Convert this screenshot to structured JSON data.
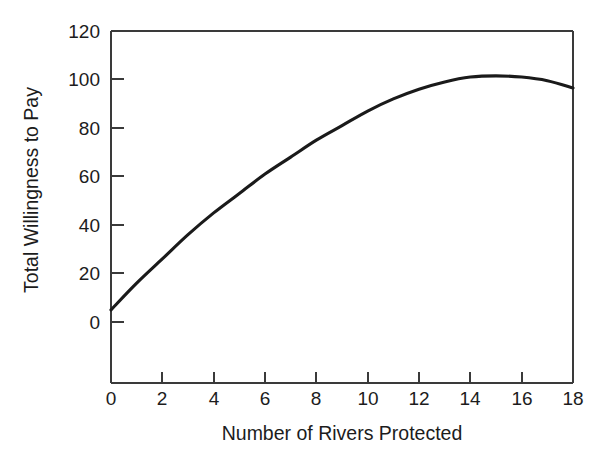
{
  "chart_data": {
    "type": "line",
    "title": "",
    "subtitle": "",
    "xlabel": "Number of Rivers Protected",
    "ylabel": "Total Willingness to Pay",
    "xlim": [
      0,
      18
    ],
    "ylim": [
      0,
      120
    ],
    "xticks": [
      0,
      2,
      4,
      6,
      8,
      10,
      12,
      14,
      16,
      18
    ],
    "yticks": [
      0,
      20,
      40,
      60,
      80,
      100,
      120
    ],
    "xtick_labels": [
      "0",
      "2",
      "4",
      "6",
      "8",
      "10",
      "12",
      "14",
      "16",
      "18"
    ],
    "ytick_labels": [
      "0",
      "20",
      "40",
      "60",
      "80",
      "100",
      "120"
    ],
    "grid": false,
    "legend": false,
    "legend_position": "none",
    "line_color": "#1a1a1a",
    "background_color": "#ffffff",
    "axis_color": "#3a3a3a",
    "series": [
      {
        "name": "Total Willingness to Pay",
        "x": [
          0,
          1,
          2,
          3,
          4,
          5,
          6,
          7,
          8,
          9,
          10,
          11,
          12,
          13,
          14,
          15,
          16,
          17,
          18
        ],
        "values": [
          5,
          16,
          26,
          36,
          45,
          53,
          61,
          68,
          75,
          81,
          87,
          92,
          96,
          99,
          101,
          101.5,
          101,
          99.5,
          96.5
        ]
      }
    ],
    "annotations": []
  }
}
